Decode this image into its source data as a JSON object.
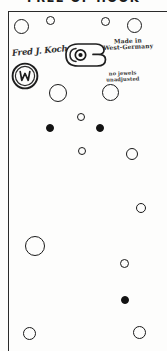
{
  "document": {
    "title_text": "FREE OF HOOK",
    "type": "scanned technical drawing",
    "subject": "watch movement base plate"
  },
  "frame": {
    "border_color": "#2a2a2a",
    "background_color": "#fdfdfc"
  },
  "annotations": {
    "signature": "Fred J. Koch",
    "made_in_line1": "Made in",
    "made_in_line2": "West-Germany",
    "jewels_line1": "no jewels",
    "jewels_line2": "unadjusted"
  },
  "seal": {
    "name": "maker-seal",
    "monogram": "W",
    "outer_radius": 13,
    "inner_radius": 10
  },
  "clamp": {
    "name": "clamp-bracket",
    "hole_radius": 4
  },
  "chart_data": {
    "type": "scatter",
    "title": "FREE OF HOOK",
    "xlabel": "",
    "ylabel": "",
    "xlim": [
      0,
      159
    ],
    "ylim": [
      0,
      340
    ],
    "grid": false,
    "legend": "none",
    "series": [
      {
        "name": "open holes",
        "marker": "open-circle",
        "points": [
          {
            "x": 20,
            "y": 21,
            "r": 8.5
          },
          {
            "x": 64,
            "y": 16,
            "r": 5.0
          },
          {
            "x": 140,
            "y": 17,
            "r": 5.0
          },
          {
            "x": 178,
            "y": 21,
            "r": 8.0
          },
          {
            "x": 70,
            "y": 80,
            "r": 9.5
          },
          {
            "x": 140,
            "y": 79,
            "r": 9.0
          },
          {
            "x": 102,
            "y": 113,
            "r": 4.5
          },
          {
            "x": 102,
            "y": 147,
            "r": 4.5
          },
          {
            "x": 170,
            "y": 153,
            "r": 6.5
          },
          {
            "x": 181,
            "y": 212,
            "r": 5.5
          },
          {
            "x": 31,
            "y": 244,
            "r": 10.0
          },
          {
            "x": 160,
            "y": 264,
            "r": 4.5
          },
          {
            "x": 28,
            "y": 334,
            "r": 6.5
          },
          {
            "x": 178,
            "y": 333,
            "r": 6.5
          }
        ]
      },
      {
        "name": "filled holes",
        "marker": "filled-circle",
        "points": [
          {
            "x": 53,
            "y": 128,
            "r": 4.0
          },
          {
            "x": 122,
            "y": 128,
            "r": 4.0
          },
          {
            "x": 161,
            "y": 302,
            "r": 3.8
          }
        ]
      }
    ]
  },
  "holes": [
    {
      "name": "hole-top-1",
      "x": 14,
      "y": 19,
      "d": 15,
      "fill": false
    },
    {
      "name": "hole-top-2",
      "x": 46,
      "y": 16,
      "d": 9,
      "fill": false
    },
    {
      "name": "hole-top-3",
      "x": 101,
      "y": 17,
      "d": 9,
      "fill": false
    },
    {
      "name": "hole-top-4",
      "x": 127,
      "y": 18,
      "d": 15,
      "fill": false
    },
    {
      "name": "hole-mid-1",
      "x": 49,
      "y": 84,
      "d": 18,
      "fill": false
    },
    {
      "name": "hole-mid-2",
      "x": 102,
      "y": 84,
      "d": 17,
      "fill": false
    },
    {
      "name": "hole-mid-3",
      "x": 77,
      "y": 113,
      "d": 8,
      "fill": false
    },
    {
      "name": "hole-dot-1",
      "x": 46,
      "y": 124,
      "d": 8,
      "fill": true
    },
    {
      "name": "hole-dot-2",
      "x": 96,
      "y": 124,
      "d": 8,
      "fill": true
    },
    {
      "name": "hole-mid-4",
      "x": 78,
      "y": 147,
      "d": 8,
      "fill": false
    },
    {
      "name": "hole-right-1",
      "x": 126,
      "y": 148,
      "d": 12,
      "fill": false
    },
    {
      "name": "hole-right-2",
      "x": 136,
      "y": 203,
      "d": 10,
      "fill": false
    },
    {
      "name": "hole-low-1",
      "x": 25,
      "y": 236,
      "d": 20,
      "fill": false
    },
    {
      "name": "hole-low-2",
      "x": 120,
      "y": 259,
      "d": 9,
      "fill": false
    },
    {
      "name": "hole-dot-3",
      "x": 121,
      "y": 296,
      "d": 8,
      "fill": true
    },
    {
      "name": "hole-bot-1",
      "x": 23,
      "y": 327,
      "d": 13,
      "fill": false
    },
    {
      "name": "hole-bot-2",
      "x": 133,
      "y": 326,
      "d": 13,
      "fill": false
    }
  ]
}
